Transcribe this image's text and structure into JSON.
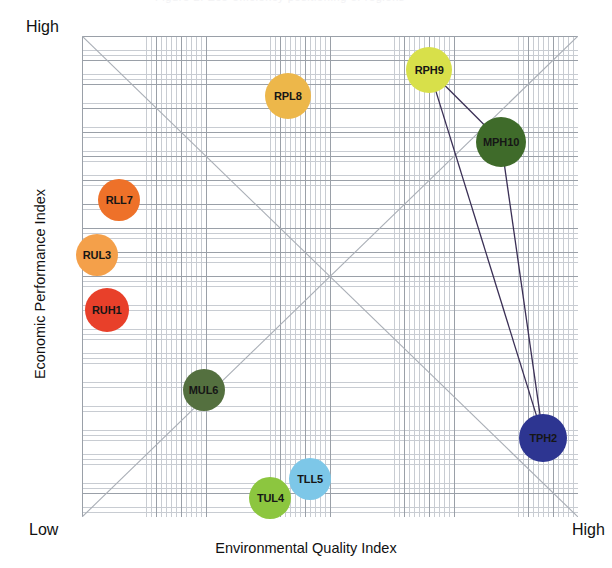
{
  "top_strip": {
    "ghost_text": "Figure  2.  Eco-efficiency  positioning  of  regions"
  },
  "axis": {
    "x_title": "Environmental Quality Index",
    "y_title": "Economic Performance Index",
    "x_low_label": "Low",
    "x_high_label": "High",
    "y_high_label": "High"
  },
  "chart_data": {
    "type": "scatter",
    "title": "",
    "xlabel": "Environmental Quality Index",
    "ylabel": "Economic Performance Index",
    "xlim": [
      0,
      100
    ],
    "ylim": [
      0,
      100
    ],
    "xtick_labels": [
      "Low",
      "High"
    ],
    "ytick_labels": [
      "High"
    ],
    "grid": true,
    "legend": "none",
    "annotations": [
      "Diagonal reference line from bottom-left to top-right",
      "Diagonal reference line from top-left to bottom-right"
    ],
    "points": [
      {
        "label": "RPH9",
        "x": 70.0,
        "y": 93.0,
        "color": "#d8e04a",
        "r": 23
      },
      {
        "label": "RPL8",
        "x": 41.5,
        "y": 87.5,
        "color": "#edb74a",
        "r": 23
      },
      {
        "label": "MPH10",
        "x": 84.5,
        "y": 78.0,
        "color": "#3f6b2a",
        "r": 25
      },
      {
        "label": "RLL7",
        "x": 7.5,
        "y": 66.0,
        "color": "#ee7129",
        "r": 21
      },
      {
        "label": "RUL3",
        "x": 3.0,
        "y": 54.5,
        "color": "#f4a04a",
        "r": 21
      },
      {
        "label": "RUH1",
        "x": 5.0,
        "y": 43.0,
        "color": "#e8402a",
        "r": 22
      },
      {
        "label": "MUL6",
        "x": 24.5,
        "y": 26.5,
        "color": "#54703f",
        "r": 21
      },
      {
        "label": "TPH2",
        "x": 93.0,
        "y": 16.5,
        "color": "#2d3591",
        "r": 24
      },
      {
        "label": "TLL5",
        "x": 46.0,
        "y": 8.0,
        "color": "#7dc7e8",
        "r": 21
      },
      {
        "label": "TUL4",
        "x": 38.0,
        "y": 4.0,
        "color": "#8cc63f",
        "r": 21
      }
    ],
    "connections": [
      {
        "from": "RPH9",
        "to": "MPH10"
      },
      {
        "from": "MPH10",
        "to": "TPH2"
      },
      {
        "from": "TPH2",
        "to": "RPH9"
      }
    ],
    "connection_color": "#3a2f55"
  }
}
